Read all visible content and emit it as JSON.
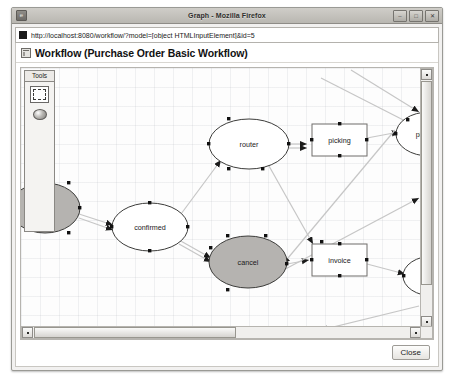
{
  "window": {
    "title": "Graph - Mozilla Firefox",
    "app_icon": "firefox-icon",
    "buttons": [
      {
        "name": "minimize",
        "glyph": "–"
      },
      {
        "name": "maximize",
        "glyph": "□"
      },
      {
        "name": "close",
        "glyph": "✕"
      }
    ]
  },
  "location": {
    "url": "http://localhost:8080/workflow/?model=[object HTMLInputElement]&id=5",
    "favicon": "page-icon"
  },
  "page": {
    "heading": "Workflow (Purchase Order Basic Workflow)",
    "heading_icon": "workflow-icon"
  },
  "tools": {
    "title": "Tools",
    "items": [
      {
        "name": "rectangle-tool",
        "label": "Rectangle",
        "selected": true
      },
      {
        "name": "ellipse-tool",
        "label": "Ellipse",
        "selected": false
      }
    ]
  },
  "footer": {
    "close_label": "Close"
  },
  "scrollbars": {
    "vertical": {
      "up": "▲",
      "down": "▼"
    },
    "horizontal": {
      "left": "◄",
      "right": "►"
    }
  },
  "graph": {
    "colors": {
      "node_fill_selected": "#b5b3b0",
      "node_fill": "#ffffff",
      "node_stroke": "#3c3c3a",
      "edge": "#c6c6c6",
      "handle": "#111111",
      "canvas_bg": "#fdfdfd"
    },
    "nodes": [
      {
        "id": "draft",
        "label": "draft",
        "shape": "ellipse",
        "cx": 24,
        "cy": 140,
        "rx": 35,
        "ry": 25,
        "filled": true,
        "selected": true,
        "clipped": "left"
      },
      {
        "id": "confirmed",
        "label": "confirmed",
        "shape": "ellipse",
        "cx": 129,
        "cy": 159,
        "rx": 38,
        "ry": 24,
        "filled": false,
        "selected": true
      },
      {
        "id": "router",
        "label": "router",
        "shape": "ellipse",
        "cx": 228,
        "cy": 76,
        "rx": 40,
        "ry": 25,
        "filled": false,
        "selected": true
      },
      {
        "id": "cancel",
        "label": "cancel",
        "shape": "ellipse",
        "cx": 227,
        "cy": 194,
        "rx": 39,
        "ry": 26,
        "filled": true,
        "selected": true
      },
      {
        "id": "picking",
        "label": "picking",
        "shape": "rect",
        "x": 291,
        "y": 56,
        "w": 55,
        "h": 32,
        "filled": false,
        "selected": true
      },
      {
        "id": "invoice",
        "label": "invoice",
        "shape": "rect",
        "x": 291,
        "y": 176,
        "w": 55,
        "h": 32,
        "filled": false,
        "selected": true
      },
      {
        "id": "picking2",
        "label": "pickin",
        "shape": "ellipse",
        "cx": 408,
        "cy": 66,
        "rx": 33,
        "ry": 22,
        "filled": false,
        "selected": true,
        "clipped": "right"
      },
      {
        "id": "node8",
        "label": "",
        "shape": "ellipse",
        "cx": 412,
        "cy": 208,
        "rx": 30,
        "ry": 20,
        "filled": false,
        "selected": true,
        "clipped": "right"
      }
    ],
    "edges": [
      {
        "from": "draft",
        "to": "confirmed"
      },
      {
        "from": "confirmed",
        "to": "router"
      },
      {
        "from": "confirmed",
        "to": "cancel"
      },
      {
        "from": "router",
        "to": "picking"
      },
      {
        "from": "router",
        "to": "invoice"
      },
      {
        "from": "picking",
        "to": "picking2"
      },
      {
        "from": "cancel",
        "to": "invoice"
      },
      {
        "from": "invoice",
        "to": "node8"
      },
      {
        "from": "picking2",
        "to": "cancel"
      }
    ]
  }
}
